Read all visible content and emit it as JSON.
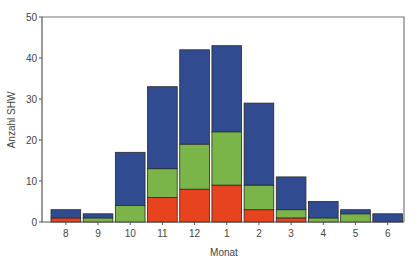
{
  "chart_data": {
    "type": "bar",
    "stacked": true,
    "title": "",
    "xlabel": "Monat",
    "ylabel": "Anzahl SHW",
    "ylim": [
      0,
      50
    ],
    "yticks": [
      0,
      10,
      20,
      30,
      40,
      50
    ],
    "categories": [
      "8",
      "9",
      "10",
      "11",
      "12",
      "1",
      "2",
      "3",
      "4",
      "5",
      "6"
    ],
    "series": [
      {
        "name": "red",
        "color": "#e8431f",
        "values": [
          1,
          0,
          0,
          6,
          8,
          9,
          3,
          1,
          0,
          0,
          0
        ]
      },
      {
        "name": "green",
        "color": "#7bb54a",
        "values": [
          0,
          1,
          4,
          7,
          11,
          13,
          6,
          2,
          1,
          2,
          0
        ]
      },
      {
        "name": "blue",
        "color": "#304b8f",
        "values": [
          2,
          1,
          13,
          20,
          23,
          21,
          20,
          8,
          4,
          1,
          2
        ]
      }
    ],
    "totals": [
      3,
      2,
      17,
      33,
      42,
      43,
      29,
      11,
      5,
      3,
      2
    ],
    "grid": false,
    "legend": "none"
  }
}
